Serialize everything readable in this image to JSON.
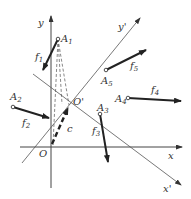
{
  "diagram": {
    "axes": {
      "x": {
        "label": "x"
      },
      "y": {
        "label": "y"
      },
      "x_prime": {
        "label": "x'"
      },
      "y_prime": {
        "label": "y'"
      }
    },
    "origins": {
      "O": {
        "label": "O"
      },
      "O_prime": {
        "label": "O'"
      }
    },
    "vector_c": {
      "label": "c"
    },
    "points": [
      {
        "id": "A1",
        "label": "A",
        "sub": "1",
        "force": "f",
        "force_sub": "1"
      },
      {
        "id": "A2",
        "label": "A",
        "sub": "2",
        "force": "f",
        "force_sub": "2"
      },
      {
        "id": "A3",
        "label": "A",
        "sub": "3",
        "force": "f",
        "force_sub": "3"
      },
      {
        "id": "A4",
        "label": "A",
        "sub": "4",
        "force": "f",
        "force_sub": "4"
      },
      {
        "id": "A5",
        "label": "A",
        "sub": "5",
        "force": "f",
        "force_sub": "5"
      }
    ],
    "colors": {
      "ink": "#222222",
      "thin": "#555555",
      "background": "#ffffff"
    }
  }
}
